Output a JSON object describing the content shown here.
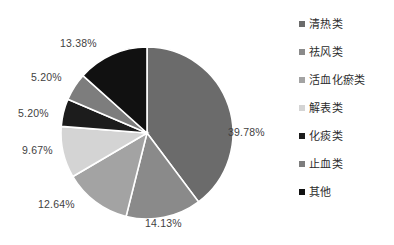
{
  "chart_data": {
    "type": "pie",
    "title": "",
    "subtitle": "",
    "xlabel": "",
    "ylabel": "",
    "legend_position": "right",
    "grid": false,
    "unit": "%",
    "start_angle_deg": 0,
    "direction": "clockwise",
    "categories": [
      "清热类",
      "祛风类",
      "活血化瘀类",
      "解表类",
      "化痰类",
      "止血类",
      "其他"
    ],
    "values": [
      39.78,
      14.13,
      12.64,
      9.67,
      5.2,
      5.2,
      13.38
    ],
    "data_labels": [
      "39.78%",
      "14.13%",
      "12.64%",
      "9.67%",
      "5.20%",
      "5.20%",
      "13.38%"
    ],
    "colors": [
      "#6b6b6b",
      "#8a8a8a",
      "#a3a3a3",
      "#d4d4d4",
      "#1c1c1c",
      "#7d7d7d",
      "#111111"
    ],
    "slices": [
      {
        "label": "清热类",
        "value": 39.78,
        "display": "39.78%",
        "color": "#6b6b6b"
      },
      {
        "label": "祛风类",
        "value": 14.13,
        "display": "14.13%",
        "color": "#8a8a8a"
      },
      {
        "label": "活血化瘀类",
        "value": 12.64,
        "display": "12.64%",
        "color": "#a3a3a3"
      },
      {
        "label": "解表类",
        "value": 9.67,
        "display": "9.67%",
        "color": "#d4d4d4"
      },
      {
        "label": "化痰类",
        "value": 5.2,
        "display": "5.20%",
        "color": "#1c1c1c"
      },
      {
        "label": "止血类",
        "value": 5.2,
        "display": "5.20%",
        "color": "#7d7d7d"
      },
      {
        "label": "其他",
        "value": 13.38,
        "display": "13.38%",
        "color": "#111111"
      }
    ]
  },
  "legend": {
    "items": [
      {
        "label": "清热类",
        "color": "#6b6b6b"
      },
      {
        "label": "祛风类",
        "color": "#8a8a8a"
      },
      {
        "label": "活血化瘀类",
        "color": "#a3a3a3"
      },
      {
        "label": "解表类",
        "color": "#d4d4d4"
      },
      {
        "label": "化痰类",
        "color": "#1c1c1c"
      },
      {
        "label": "止血类",
        "color": "#7d7d7d"
      },
      {
        "label": "其他",
        "color": "#111111"
      }
    ]
  },
  "labels": {
    "slice_0": "39.78%",
    "slice_1": "14.13%",
    "slice_2": "12.64%",
    "slice_3": "9.67%",
    "slice_4": "5.20%",
    "slice_5": "5.20%",
    "slice_6": "13.38%"
  },
  "style": {
    "slice_border": "#ffffff",
    "label_color": "#3f3f3f",
    "background": "#ffffff"
  }
}
